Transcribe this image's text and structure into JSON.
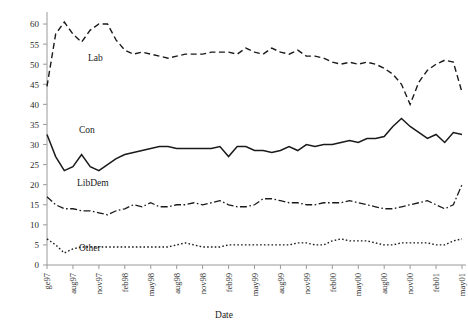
{
  "chart_data": {
    "type": "line",
    "title": "",
    "xlabel": "Date",
    "ylabel": "",
    "ylim": [
      0,
      62
    ],
    "yticks": [
      0,
      5,
      10,
      15,
      20,
      25,
      30,
      35,
      40,
      45,
      50,
      55,
      60
    ],
    "grid": false,
    "legend_position": "inline-labels",
    "xtick_labels": [
      "ge97",
      "aug97",
      "nov97",
      "feb98",
      "may98",
      "aug98",
      "nov98",
      "feb99",
      "may99",
      "aug99",
      "nov99",
      "feb00",
      "may00",
      "aug00",
      "nov00",
      "feb01",
      "may01"
    ],
    "xtick_step_months": 3,
    "n_points": 49,
    "series": [
      {
        "name": "Lab",
        "style": "dashed",
        "label_x_index": 4,
        "values": [
          44.5,
          57.5,
          60.5,
          57.5,
          55.5,
          58.5,
          60.0,
          60.0,
          56.0,
          53.5,
          52.5,
          53.0,
          52.5,
          52.0,
          51.5,
          52.0,
          52.5,
          52.5,
          52.5,
          53.0,
          53.0,
          53.0,
          52.5,
          54.0,
          53.0,
          52.5,
          54.0,
          53.0,
          52.5,
          53.5,
          52.0,
          52.0,
          51.5,
          50.5,
          50.0,
          50.5,
          50.0,
          50.5,
          50.0,
          49.0,
          47.5,
          45.0,
          40.0,
          45.5,
          48.5,
          50.0,
          51.0,
          50.5,
          43.0
        ]
      },
      {
        "name": "Con",
        "style": "solid",
        "label_x_index": 2,
        "values": [
          32.5,
          27.0,
          23.5,
          24.5,
          27.5,
          24.5,
          23.5,
          25.0,
          26.5,
          27.5,
          28.0,
          28.5,
          29.0,
          29.5,
          29.5,
          29.0,
          29.0,
          29.0,
          29.0,
          29.0,
          29.5,
          27.0,
          29.5,
          29.5,
          28.5,
          28.5,
          28.0,
          28.5,
          29.5,
          28.5,
          30.0,
          29.5,
          30.0,
          30.0,
          30.5,
          31.0,
          30.5,
          31.5,
          31.5,
          32.0,
          34.5,
          36.5,
          34.5,
          33.0,
          31.5,
          32.5,
          30.5,
          33.0,
          32.5
        ]
      },
      {
        "name": "LibDem",
        "style": "dashdot",
        "label_x_index": 3,
        "values": [
          17.0,
          15.0,
          14.0,
          14.0,
          13.5,
          13.5,
          13.0,
          12.5,
          13.5,
          14.0,
          15.0,
          14.5,
          15.5,
          14.5,
          14.5,
          15.0,
          15.0,
          15.5,
          15.0,
          15.5,
          16.0,
          15.0,
          14.5,
          14.5,
          15.0,
          16.5,
          16.5,
          16.0,
          15.5,
          15.5,
          15.0,
          15.0,
          15.5,
          15.5,
          15.5,
          16.0,
          15.5,
          15.0,
          14.5,
          14.0,
          14.0,
          14.5,
          15.0,
          15.5,
          16.0,
          15.0,
          14.0,
          15.0,
          20.0
        ]
      },
      {
        "name": "Other",
        "style": "dotted",
        "label_x_index": 2,
        "values": [
          6.5,
          5.0,
          3.0,
          4.0,
          4.5,
          4.5,
          4.5,
          4.5,
          4.5,
          4.5,
          4.5,
          4.5,
          4.5,
          4.5,
          4.5,
          5.0,
          5.5,
          5.0,
          4.5,
          4.5,
          4.5,
          5.0,
          5.0,
          5.0,
          5.0,
          5.0,
          5.0,
          5.0,
          5.0,
          5.5,
          5.5,
          5.0,
          5.0,
          6.0,
          6.5,
          6.0,
          6.0,
          6.0,
          5.5,
          5.0,
          5.0,
          5.5,
          5.5,
          5.5,
          5.5,
          5.0,
          5.0,
          6.0,
          6.5
        ]
      }
    ]
  },
  "colors": {
    "line": "#1a1a1a",
    "axis": "#9a9a9a",
    "text": "#1a1a1a",
    "background": "#ffffff"
  }
}
